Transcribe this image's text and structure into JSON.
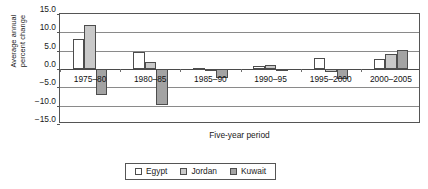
{
  "chart_data": {
    "type": "bar",
    "title": "",
    "xlabel": "Five-year period",
    "ylabel_line1": "Average annual",
    "ylabel_line2": "percent change",
    "categories": [
      "1975–80",
      "1980–85",
      "1985–90",
      "1990–95",
      "1995–2000",
      "2000–2005"
    ],
    "series": [
      {
        "name": "Egypt",
        "color": "#ffffff",
        "values": [
          8.2,
          4.7,
          0.3,
          0.7,
          3.0,
          2.8
        ]
      },
      {
        "name": "Jordan",
        "color": "#c9c9c9",
        "values": [
          12.0,
          1.8,
          0.1,
          1.2,
          -0.7,
          4.0
        ]
      },
      {
        "name": "Kuwait",
        "color": "#a3a3a3",
        "values": [
          -7.0,
          -9.7,
          -2.5,
          0.0,
          -2.8,
          5.2
        ]
      }
    ],
    "ylim": [
      -15.0,
      15.0
    ],
    "yticks": [
      "15.0",
      "10.0",
      "5.0",
      "0.0",
      "−5.0",
      "−10.0",
      "−15.0"
    ],
    "ytick_values": [
      15.0,
      10.0,
      5.0,
      0.0,
      -5.0,
      -10.0,
      -15.0
    ],
    "grid": true,
    "legend_position": "bottom"
  },
  "legend": {
    "items": [
      {
        "label": "Egypt"
      },
      {
        "label": "Jordan"
      },
      {
        "label": "Kuwait"
      }
    ]
  }
}
